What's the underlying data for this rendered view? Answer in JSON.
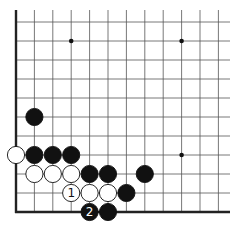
{
  "diagram": {
    "type": "go-board-fragment",
    "grid": {
      "columns_x": [
        16,
        34.4,
        52.8,
        71.2,
        89.6,
        108,
        126.4,
        144.8,
        163.2,
        181.6,
        200,
        218.4
      ],
      "rows_y": [
        22,
        41,
        60,
        79,
        98,
        117,
        136,
        155,
        174,
        193,
        212
      ],
      "top_extend_y": 10,
      "right_extend_x": 230,
      "left_edge": true,
      "bottom_edge": true,
      "line_color": "#555555",
      "edge_color": "#222222"
    },
    "star_points": [
      {
        "col": 3,
        "row": 1
      },
      {
        "col": 9,
        "row": 1
      },
      {
        "col": 9,
        "row": 7
      }
    ],
    "stones": [
      {
        "color": "black",
        "col": 1,
        "row": 5,
        "label": ""
      },
      {
        "color": "white",
        "col": 0,
        "row": 7,
        "label": ""
      },
      {
        "color": "black",
        "col": 1,
        "row": 7,
        "label": ""
      },
      {
        "color": "black",
        "col": 2,
        "row": 7,
        "label": ""
      },
      {
        "color": "black",
        "col": 3,
        "row": 7,
        "label": ""
      },
      {
        "color": "white",
        "col": 1,
        "row": 8,
        "label": ""
      },
      {
        "color": "white",
        "col": 2,
        "row": 8,
        "label": ""
      },
      {
        "color": "white",
        "col": 3,
        "row": 8,
        "label": ""
      },
      {
        "color": "black",
        "col": 4,
        "row": 8,
        "label": ""
      },
      {
        "color": "black",
        "col": 5,
        "row": 8,
        "label": ""
      },
      {
        "color": "black",
        "col": 7,
        "row": 8,
        "label": ""
      },
      {
        "color": "white",
        "col": 3,
        "row": 9,
        "label": "1"
      },
      {
        "color": "white",
        "col": 4,
        "row": 9,
        "label": ""
      },
      {
        "color": "white",
        "col": 5,
        "row": 9,
        "label": ""
      },
      {
        "color": "black",
        "col": 6,
        "row": 9,
        "label": ""
      },
      {
        "color": "black",
        "col": 4,
        "row": 10,
        "label": "2"
      },
      {
        "color": "black",
        "col": 5,
        "row": 10,
        "label": ""
      }
    ],
    "colors": {
      "black_stone": "#111111",
      "white_stone": "#ffffff",
      "stone_outline": "#111111",
      "star_point": "#111111"
    }
  }
}
